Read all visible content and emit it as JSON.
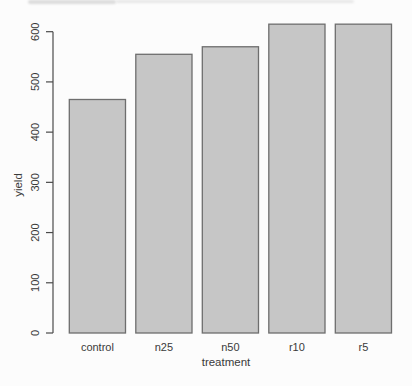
{
  "chart_data": {
    "type": "bar",
    "title": "",
    "xlabel": "treatment",
    "ylabel": "yield",
    "categories": [
      "control",
      "n25",
      "n50",
      "r10",
      "r5"
    ],
    "values": [
      465,
      555,
      570,
      615,
      615
    ],
    "ylim": [
      0,
      620
    ],
    "yticks": [
      0,
      100,
      200,
      300,
      400,
      500,
      600
    ],
    "grid": false,
    "legend": "none",
    "tick_label_orientation": "rotated-90",
    "bar_fill": "#c6c6c6",
    "bar_border": "#6e6e6e",
    "axis_color": "#4a4a4a",
    "text_color": "#3a3a3a",
    "background_color": "#fcfcfc"
  }
}
